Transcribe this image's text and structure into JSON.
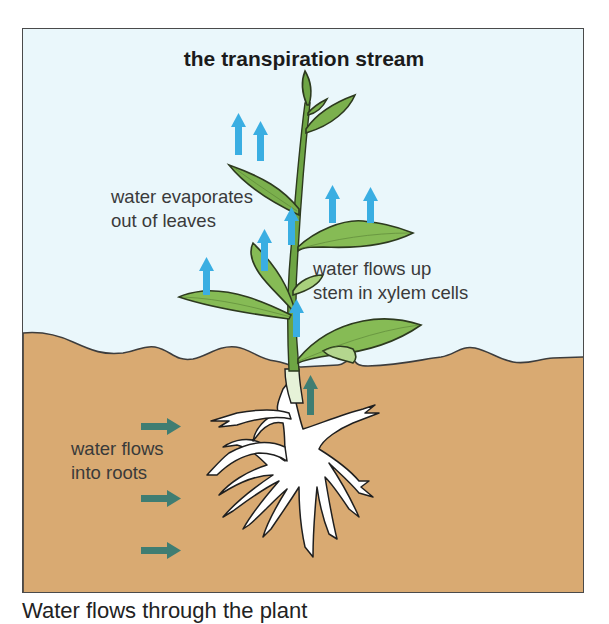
{
  "diagram": {
    "title": "the transpiration stream",
    "labels": {
      "evaporate": {
        "line1": "water evaporates",
        "line2": "out of leaves"
      },
      "xylem": {
        "line1": "water flows up",
        "line2": "stem in xylem cells"
      },
      "roots": {
        "line1": "water flows",
        "line2": "into roots"
      }
    },
    "caption": "Water flows through the plant",
    "colors": {
      "sky": "#eaf7fb",
      "soil": "#d9aa72",
      "outline": "#3d3d3d",
      "leaf": "#7bb04d",
      "leaf_light": "#a9d07c",
      "stem": "#6ea544",
      "root": "#ffffff",
      "vapour_arrow": "#3aaee2",
      "water_arrow": "#3f7d72"
    },
    "arrows": {
      "vapour_up_count": 9,
      "stem_up_count": 1,
      "root_inflow_count": 3
    }
  }
}
